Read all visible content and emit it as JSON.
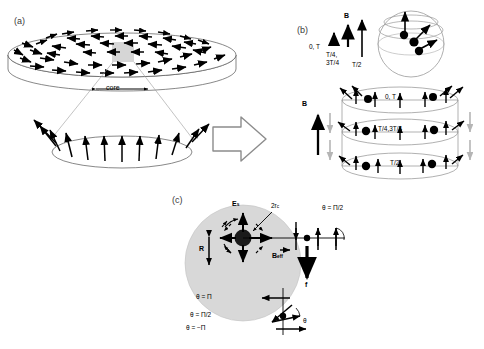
{
  "figure": {
    "panels": [
      {
        "id": "a",
        "label": "(a)"
      },
      {
        "id": "b",
        "label": "(b)"
      },
      {
        "id": "c",
        "label": "(c)"
      }
    ]
  },
  "panel_a": {
    "label": "(a)",
    "core_label": "core",
    "description": "Magnetic disk with in-plane curling spins and out-of-plane vortex core, with magnified lower ellipse"
  },
  "panel_b": {
    "label": "(b)",
    "field_label_top": "B",
    "field_label_bottom": "B",
    "time_labels": [
      "0, T",
      "T/4,\n3T/4",
      "T/2"
    ],
    "time_0T": "0, T",
    "time_quarter": "T/4,",
    "time_quarter2": "3T/4",
    "time_half": "T/2",
    "ring_labels": [
      "0, T",
      "T/4,3T/4",
      "T/2"
    ],
    "ring_0T": "0, T",
    "ring_quarter": "T/4,3T/4",
    "ring_half": "T/2"
  },
  "panel_c": {
    "label": "(c)",
    "es_label": "E",
    "es_sub": "s",
    "core_diameter_label": "2r",
    "core_diameter_sub": "c",
    "radius_label": "R",
    "beff_label": "B",
    "beff_sub": "eff",
    "force_label": "f",
    "theta_right": "θ = Π/2",
    "theta_pi": "θ = Π",
    "theta_half_pi": "θ = Π/2",
    "theta_neg_pi": "θ = −Π",
    "theta_symbol": "θ"
  },
  "colors": {
    "ink": "#000000",
    "outline": "#555555",
    "disk_gray": "#d8d8d8",
    "arrow_gray": "#b5b5b5",
    "label_gray": "#3a3a3a"
  }
}
